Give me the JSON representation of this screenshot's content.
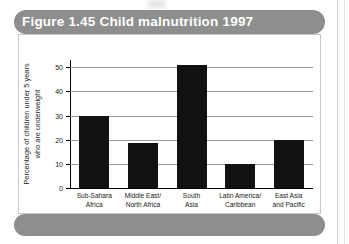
{
  "figure": {
    "title": "Figure 1.45 Child malnutrition 1997",
    "title_bar_color": "#8e8e8e",
    "title_text_color": "#ffffff",
    "panel_background": "#ffffff",
    "bar_color": "#111111",
    "gridline_color": "#9a9a9a"
  },
  "chart_data": {
    "type": "bar",
    "title": "Figure 1.45 Child malnutrition 1997",
    "xlabel": "",
    "ylabel": "Percentage of children under 5 years who are underweight",
    "ylabel_lines": [
      "Percentage of children under 5 years",
      "who are underweight"
    ],
    "categories": [
      "Sub-Sahara Africa",
      "Middle East/ North Africa",
      "South Asia",
      "Latin America/ Caribbean",
      "East Asia and Pacific"
    ],
    "category_lines": [
      [
        "Sub-Sahara",
        "Africa"
      ],
      [
        "Middle East/",
        "North Africa"
      ],
      [
        "South",
        "Asia"
      ],
      [
        "Latin America/",
        "Caribbean"
      ],
      [
        "East Asia",
        "and Pacific"
      ]
    ],
    "values": [
      30,
      18.5,
      51,
      10,
      20
    ],
    "ylim": [
      0,
      53
    ],
    "yticks": [
      0,
      10,
      20,
      30,
      40,
      50
    ],
    "ytick_labels": [
      "0",
      "10",
      "20",
      "30",
      "40",
      "50"
    ],
    "grid": true,
    "legend": false
  }
}
